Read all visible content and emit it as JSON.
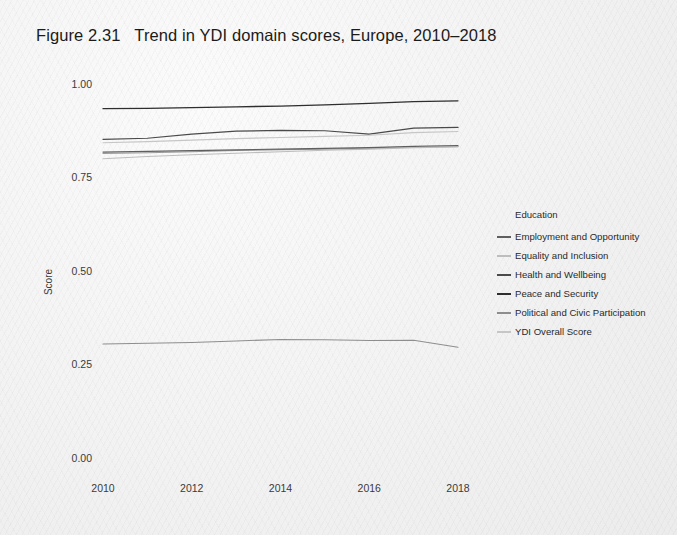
{
  "figure": {
    "title": "Figure 2.31   Trend in YDI domain scores, Europe, 2010–2018"
  },
  "legend": {
    "title": "Education"
  },
  "chart_data": {
    "type": "line",
    "title": "Figure 2.31   Trend in YDI domain scores, Europe, 2010–2018",
    "xlabel": "",
    "ylabel": "Score",
    "x": [
      2010,
      2011,
      2012,
      2013,
      2014,
      2015,
      2016,
      2017,
      2018
    ],
    "xlim": [
      2009.6,
      2018.6
    ],
    "ylim": [
      0.0,
      1.02
    ],
    "xticks": [
      2010,
      2012,
      2014,
      2016,
      2018
    ],
    "xtick_labels": [
      "2010",
      "2012",
      "2014",
      "2016",
      "2018"
    ],
    "yticks": [
      0.0,
      0.25,
      0.5,
      0.75,
      1.0
    ],
    "ytick_labels": [
      "0.00",
      "0.25",
      "0.50",
      "0.75",
      "1.00"
    ],
    "grid": false,
    "legend_position": "right",
    "legend_title": "Education",
    "series": [
      {
        "name": "Education",
        "color": "#9a9a9a",
        "width": 1.1,
        "values": [
          0.814,
          0.816,
          0.819,
          0.822,
          0.824,
          0.826,
          0.828,
          0.831,
          0.833
        ]
      },
      {
        "name": "Employment and Opportunity",
        "color": "#5f5f5f",
        "width": 1.2,
        "values": [
          0.818,
          0.82,
          0.822,
          0.824,
          0.826,
          0.828,
          0.83,
          0.833,
          0.835
        ]
      },
      {
        "name": "Equality and Inclusion",
        "color": "#bdbdbd",
        "width": 1.1,
        "values": [
          0.8,
          0.806,
          0.811,
          0.815,
          0.819,
          0.823,
          0.826,
          0.83,
          0.832
        ]
      },
      {
        "name": "Health and Wellbeing",
        "color": "#4a4a4a",
        "width": 1.2,
        "values": [
          0.852,
          0.855,
          0.866,
          0.874,
          0.876,
          0.875,
          0.866,
          0.882,
          0.884
        ]
      },
      {
        "name": "Peace and Security",
        "color": "#2e2e2e",
        "width": 1.3,
        "values": [
          0.934,
          0.935,
          0.937,
          0.939,
          0.941,
          0.944,
          0.948,
          0.953,
          0.955
        ]
      },
      {
        "name": "Political and Civic Participation",
        "color": "#8e8e8e",
        "width": 1.1,
        "values": [
          0.305,
          0.307,
          0.309,
          0.313,
          0.317,
          0.316,
          0.314,
          0.315,
          0.296
        ]
      },
      {
        "name": "YDI Overall Score",
        "color": "#c6c6c6",
        "width": 1.1,
        "values": [
          0.843,
          0.846,
          0.85,
          0.854,
          0.857,
          0.86,
          0.863,
          0.87,
          0.873
        ]
      }
    ]
  }
}
